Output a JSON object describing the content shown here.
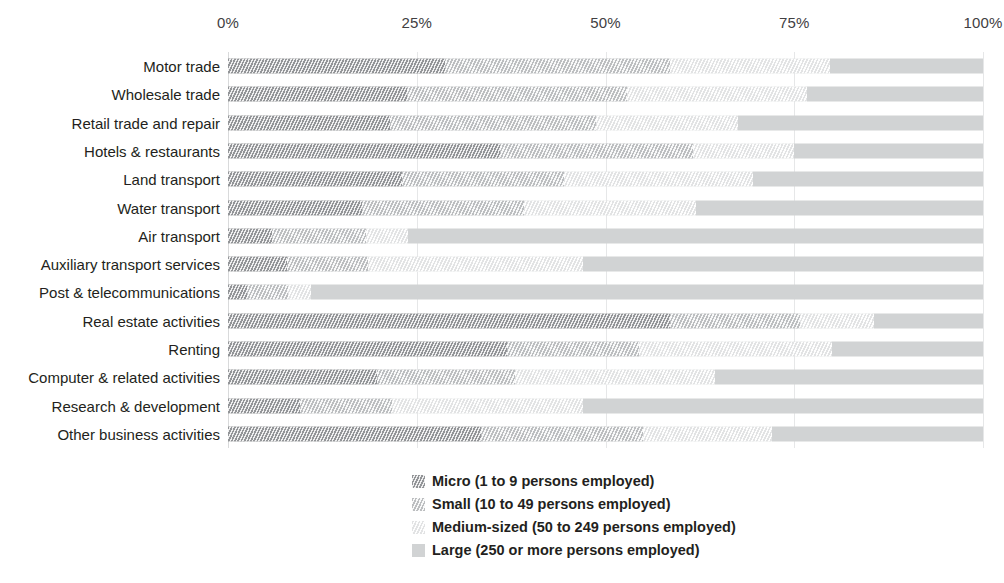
{
  "chart_data": {
    "type": "bar",
    "orientation": "horizontal",
    "stacked": true,
    "stack_mode": "percent",
    "title": "",
    "xlabel": "",
    "ylabel": "",
    "xlim": [
      0,
      100
    ],
    "grid": true,
    "x_axis_position": "top",
    "legend_position": "bottom-center",
    "x_ticks": [
      {
        "value": 0,
        "label": "0%"
      },
      {
        "value": 25,
        "label": "25%"
      },
      {
        "value": 50,
        "label": "50%"
      },
      {
        "value": 75,
        "label": "75%"
      },
      {
        "value": 100,
        "label": "100%"
      }
    ],
    "categories": [
      "Motor trade",
      "Wholesale trade",
      "Retail trade and repair",
      "Hotels & restaurants",
      "Land transport",
      "Water transport",
      "Air transport",
      "Auxiliary transport services",
      "Post & telecommunications",
      "Real estate activities",
      "Renting",
      "Computer & related activities",
      "Research & development",
      "Other business activities"
    ],
    "series": [
      {
        "name": "Micro (1 to 9 persons employed)",
        "key": "micro",
        "color": "#939598",
        "values": [
          28.7,
          23.7,
          21.5,
          36.0,
          23.0,
          17.7,
          5.8,
          7.8,
          2.5,
          58.5,
          37.0,
          19.7,
          9.5,
          33.5
        ]
      },
      {
        "name": "Small (10 to 49 persons employed)",
        "key": "small",
        "color": "#bcbec0",
        "values": [
          29.8,
          29.1,
          27.3,
          25.6,
          21.5,
          21.5,
          12.5,
          10.7,
          5.5,
          17.3,
          17.4,
          18.3,
          12.2,
          21.5
        ]
      },
      {
        "name": "Medium-sized (50 to 249 persons employed)",
        "key": "medium",
        "color": "#e2e3e4",
        "values": [
          21.2,
          23.9,
          18.7,
          13.4,
          25.0,
          22.8,
          5.5,
          28.5,
          3.0,
          9.8,
          25.6,
          26.5,
          25.3,
          17.0
        ]
      },
      {
        "name": "Large (250 or more persons employed)",
        "key": "large",
        "color": "#d1d3d4",
        "values": [
          20.3,
          23.3,
          32.5,
          25.0,
          30.5,
          38.0,
          76.2,
          53.0,
          89.0,
          14.4,
          20.0,
          35.5,
          53.0,
          28.0
        ]
      }
    ]
  },
  "legend": {
    "items": [
      {
        "label": "Micro (1 to 9 persons employed)",
        "key": "micro",
        "swatch": "hatched-dark-swatch"
      },
      {
        "label": "Small (10 to 49 persons employed)",
        "key": "small",
        "swatch": "hatched-mid-swatch"
      },
      {
        "label": "Medium-sized (50 to 249 persons employed)",
        "key": "medium",
        "swatch": "hatched-light-swatch"
      },
      {
        "label": "Large (250 or more persons employed)",
        "key": "large",
        "swatch": "solid-grey-swatch"
      }
    ]
  }
}
